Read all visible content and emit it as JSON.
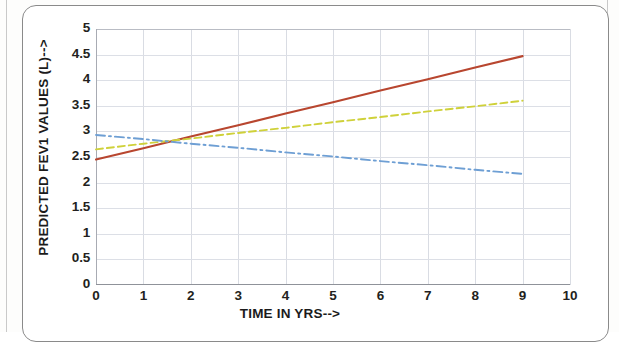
{
  "chart_data": {
    "type": "line",
    "title": "",
    "xlabel": "TIME IN YRS-->",
    "ylabel": "PREDICTED FEV1 VALUES (L)-->",
    "xlim": [
      0,
      10
    ],
    "ylim": [
      0,
      5
    ],
    "xticks": [
      "0",
      "1",
      "2",
      "3",
      "4",
      "5",
      "6",
      "7",
      "8",
      "9",
      "10"
    ],
    "yticks": [
      "0",
      "0.5",
      "1",
      "1.5",
      "2",
      "2.5",
      "3",
      "3.5",
      "4",
      "4.5",
      "5"
    ],
    "grid": "both",
    "legend": "none",
    "x": [
      0,
      1,
      2,
      3,
      4,
      5,
      6,
      7,
      8,
      9
    ],
    "series": [
      {
        "name": "series-red",
        "color": "#b8462f",
        "style": "solid",
        "values": [
          2.45,
          2.67,
          2.9,
          3.12,
          3.35,
          3.57,
          3.8,
          4.02,
          4.25,
          4.47
        ]
      },
      {
        "name": "series-green",
        "color": "#cfd13a",
        "style": "dashed",
        "values": [
          2.65,
          2.76,
          2.86,
          2.97,
          3.07,
          3.18,
          3.28,
          3.39,
          3.49,
          3.6
        ]
      },
      {
        "name": "series-blue",
        "color": "#6e9fd4",
        "style": "dash-dot",
        "values": [
          2.93,
          2.85,
          2.76,
          2.68,
          2.59,
          2.51,
          2.42,
          2.34,
          2.25,
          2.17
        ]
      }
    ]
  }
}
